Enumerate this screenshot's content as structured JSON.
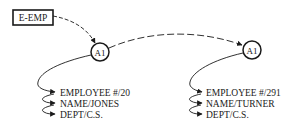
{
  "diagram": {
    "entry_box": {
      "label": "E-EMP"
    },
    "nodes": [
      {
        "label": "A1",
        "fields": [
          "EMPLOYEE #/20",
          "NAME/JONES",
          "DEPT/C.S."
        ]
      },
      {
        "label": "A1",
        "fields": [
          "EMPLOYEE #/291",
          "NAME/TURNER",
          "DEPT/C.S."
        ]
      }
    ],
    "colors": {
      "stroke": "#1a1a1a",
      "background": "#ffffff"
    }
  }
}
